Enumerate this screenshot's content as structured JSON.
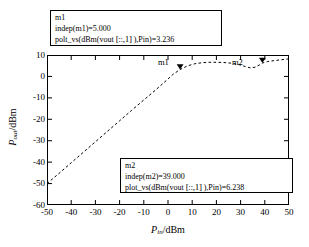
{
  "chart_data": {
    "type": "line",
    "title": "",
    "xlabel": "Pin/dBm",
    "ylabel": "Pout/dBm",
    "xlim": [
      -50,
      50
    ],
    "ylim": [
      -60,
      10
    ],
    "xticks": [
      -50,
      -40,
      -30,
      -20,
      -10,
      0,
      10,
      20,
      30,
      40,
      50
    ],
    "yticks": [
      10,
      0,
      -10,
      -20,
      -30,
      -40,
      -50,
      -60
    ],
    "grid": false,
    "legend": "none",
    "linestyle": "dashed",
    "linecolor": "#000000",
    "series": [
      {
        "name": "plot_vs(dBm(vout[::,1]),Pin)",
        "x": [
          -50,
          -45,
          -40,
          -35,
          -30,
          -25,
          -20,
          -15,
          -10,
          -5,
          0,
          2,
          5,
          8,
          11,
          14,
          17,
          20,
          23,
          26,
          29,
          32,
          34,
          36,
          38,
          39,
          41,
          44,
          47,
          50
        ],
        "y": [
          -50.0,
          -45.2,
          -40.3,
          -35.4,
          -30.5,
          -25.6,
          -20.7,
          -15.8,
          -11.0,
          -6.2,
          -1.2,
          0.9,
          3.24,
          4.9,
          5.9,
          6.4,
          6.6,
          6.6,
          6.5,
          6.2,
          5.6,
          4.6,
          4.0,
          4.3,
          5.5,
          6.24,
          6.9,
          7.4,
          7.8,
          8.2
        ]
      }
    ],
    "markers": [
      {
        "id": "m1",
        "label": "m1",
        "x": 5.0,
        "y": 3.236,
        "glyph": "triangle-down"
      },
      {
        "id": "m2",
        "label": "m2",
        "x": 39.0,
        "y": 6.238,
        "glyph": "triangle-down"
      }
    ]
  },
  "axes": {
    "x_title_main": "P",
    "x_title_sub": "in",
    "x_title_unit": "/dBm",
    "y_title_main": "P",
    "y_title_sub": "out",
    "y_title_unit": "/dBm",
    "xticklabels": [
      "-50",
      "-40",
      "-30",
      "-20",
      "-10",
      "0",
      "10",
      "20",
      "30",
      "40",
      "50"
    ],
    "yticklabels": [
      "10",
      "0",
      "-10",
      "-20",
      "-30",
      "-40",
      "-50",
      "-60"
    ]
  },
  "callouts": {
    "m1": {
      "name": "m1",
      "line1": "m1",
      "line2": "indep(m1)=5.000",
      "line3_a": "polt_vs(dBm(vout ",
      "line3_b": "[::,1]",
      "line3_c": " ),Pin)=3.236"
    },
    "m2": {
      "name": "m2",
      "line1": "m2",
      "line2": "indep(m2)=39.000",
      "line3_a": "plot_vs(dBm(vout ",
      "line3_b": "[::,1]",
      "line3_c": " ),Pin)=6.238"
    }
  },
  "marker_labels": {
    "m1": "m1",
    "m2": "m2"
  }
}
